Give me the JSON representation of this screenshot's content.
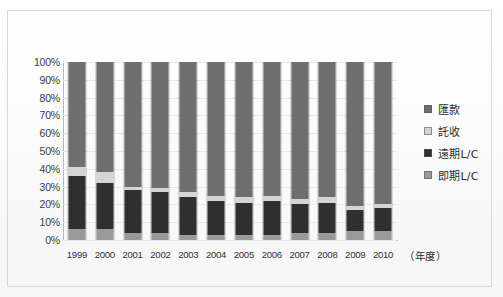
{
  "chart_data": {
    "type": "bar",
    "stacked": "100%",
    "title": "",
    "subtitle": "",
    "xlabel": "（年度）",
    "ylabel": "",
    "ylim": [
      0,
      100
    ],
    "ytick_labels": [
      "100%",
      "90%",
      "80%",
      "70%",
      "60%",
      "50%",
      "40%",
      "30%",
      "20%",
      "10%",
      "0%"
    ],
    "ytick_values": [
      100,
      90,
      80,
      70,
      60,
      50,
      40,
      30,
      20,
      10,
      0
    ],
    "grid": true,
    "legend_position": "right",
    "categories": [
      "1999",
      "2000",
      "2001",
      "2002",
      "2003",
      "2004",
      "2005",
      "2006",
      "2007",
      "2008",
      "2009",
      "2010"
    ],
    "series": [
      {
        "name": "即期L/C",
        "color": "#9a9a9a",
        "values": [
          6,
          6,
          4,
          4,
          3,
          3,
          3,
          3,
          4,
          4,
          5,
          5
        ]
      },
      {
        "name": "遠期L/C",
        "color": "#2f2f2f",
        "values": [
          30,
          26,
          24,
          23,
          21,
          19,
          18,
          19,
          16,
          17,
          12,
          13
        ]
      },
      {
        "name": "託收",
        "color": "#d5d5d5",
        "values": [
          5,
          6,
          2,
          2,
          3,
          3,
          3,
          3,
          3,
          3,
          2,
          2
        ]
      },
      {
        "name": "匯款",
        "color": "#6e6e6e",
        "values": [
          59,
          62,
          70,
          71,
          73,
          75,
          76,
          75,
          77,
          76,
          81,
          80
        ]
      }
    ],
    "legend_order": [
      "匯款",
      "託收",
      "遠期L/C",
      "即期L/C"
    ]
  },
  "legend": {
    "items": [
      {
        "label": "匯款",
        "swatch_name": "legend-swatch-remittance",
        "color": "#6e6e6e"
      },
      {
        "label": "託收",
        "swatch_name": "legend-swatch-collection",
        "color": "#d5d5d5"
      },
      {
        "label": "遠期L/C",
        "swatch_name": "legend-swatch-usance-lc",
        "color": "#2f2f2f"
      },
      {
        "label": "即期L/C",
        "swatch_name": "legend-swatch-sight-lc",
        "color": "#9a9a9a"
      }
    ]
  },
  "colors": {
    "remittance": "#6e6e6e",
    "collection": "#d5d5d5",
    "usance_lc": "#2f2f2f",
    "sight_lc": "#9a9a9a",
    "gridline": "#e7e7e7",
    "axis": "#b9b9b9",
    "frame": "#d8d8d8",
    "background": "#fbfbfb"
  }
}
